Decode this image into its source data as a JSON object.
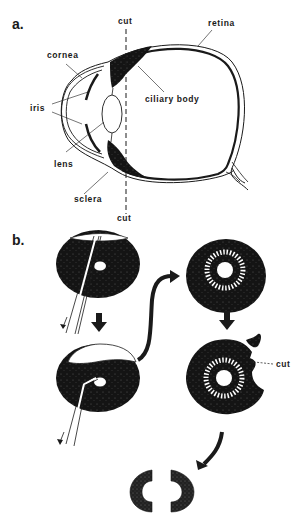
{
  "panel_a": {
    "label": "a.",
    "labels": {
      "cut_top": "cut",
      "retina": "retina",
      "cornea": "cornea",
      "iris": "iris",
      "ciliary_body": "ciliary body",
      "lens": "lens",
      "sclera": "sclera",
      "cut_bottom": "cut"
    }
  },
  "panel_b": {
    "label": "b.",
    "cut_label": "cut"
  },
  "colors": {
    "ink": "#1a1a1a",
    "background": "#ffffff"
  }
}
